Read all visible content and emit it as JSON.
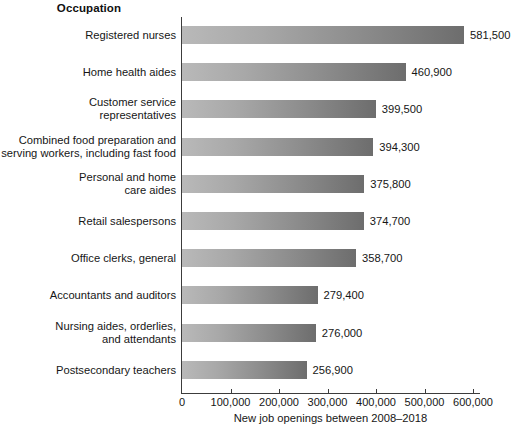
{
  "chart_data": {
    "type": "bar",
    "orientation": "horizontal",
    "title": "",
    "ylabel": "Occupation",
    "xlabel": "New job openings between 2008–2018",
    "xlim": [
      0,
      600000
    ],
    "xticks": [
      0,
      100000,
      200000,
      300000,
      400000,
      500000,
      600000
    ],
    "xtick_labels": [
      "0",
      "100,000",
      "200,000",
      "300,000",
      "400,000",
      "500,000",
      "600,000"
    ],
    "grid": false,
    "legend": null,
    "categories": [
      "Registered nurses",
      "Home health aides",
      "Customer service\nrepresentatives",
      "Combined food preparation and\nserving workers, including fast food",
      "Personal and home\ncare aides",
      "Retail salespersons",
      "Office clerks, general",
      "Accountants and auditors",
      "Nursing aides, orderlies,\nand attendants",
      "Postsecondary teachers"
    ],
    "values": [
      581500,
      460900,
      399500,
      394300,
      375800,
      374700,
      358700,
      279400,
      276000,
      256900
    ],
    "value_labels": [
      "581,500",
      "460,900",
      "399,500",
      "394,300",
      "375,800",
      "374,700",
      "358,700",
      "279,400",
      "276,000",
      "256,900"
    ],
    "bar_color_light": "#b9b9b9",
    "bar_color_dark": "#6d6d6d",
    "axis_color": "#3c3c3c"
  },
  "caption": {
    "clipped_text": ""
  }
}
